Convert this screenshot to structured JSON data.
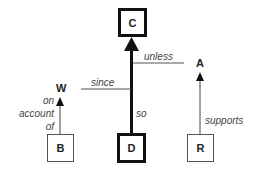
{
  "diagram": {
    "type": "Toulmin argument model",
    "nodes": {
      "claim": {
        "label": "C"
      },
      "data": {
        "label": "D"
      },
      "warrant": {
        "label": "W"
      },
      "backing": {
        "label": "B"
      },
      "rebuttal": {
        "label": "A"
      },
      "rebuttal_support": {
        "label": "R"
      }
    },
    "edges": {
      "data_to_claim": {
        "label": "so"
      },
      "warrant_link": {
        "label": "since"
      },
      "rebuttal_link": {
        "label": "unless"
      },
      "backing_to_warrant": {
        "label_lines": [
          "on",
          "account",
          "of"
        ]
      },
      "support_to_rebuttal": {
        "label": "supports"
      }
    }
  }
}
